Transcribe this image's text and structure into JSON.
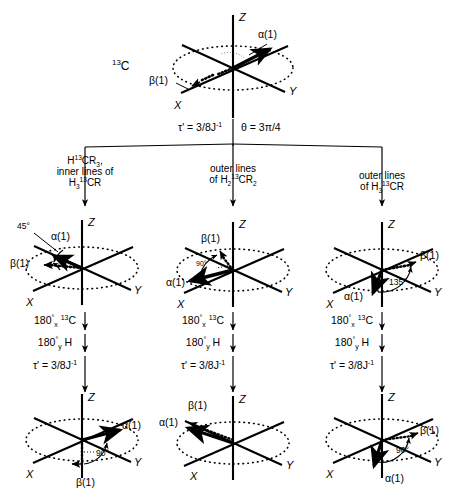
{
  "figure": {
    "nucleus_label": "13C",
    "nucleus_label_html": "C",
    "nucleus_superscript": "13"
  },
  "axes": {
    "z": "Z",
    "x": "X",
    "y": "Y"
  },
  "vectors": {
    "alpha": "α(1)",
    "beta": "β(1)"
  },
  "top": {
    "tau_label": "τ' = 3/8J",
    "tau_exponent": "-1",
    "theta_label": "θ = 3π/4"
  },
  "columns": [
    {
      "header_line1": "H",
      "header_sup1": "13",
      "header_rest1": "CR",
      "header_sub1": "3",
      "header_line1_tail": ",",
      "header_line2": "inner lines of",
      "header_line3_a": "H",
      "header_line3_sub": "3",
      "header_line3_sup": "13",
      "header_line3_b": "CR",
      "mid_angle": "45°",
      "pulse1_a": "180",
      "pulse1_deg": "°",
      "pulse1_sub": "x",
      "pulse1_sup": "13",
      "pulse1_b": "C",
      "pulse2_a": "180",
      "pulse2_deg": "°",
      "pulse2_sub": "y",
      "pulse2_b": "H",
      "tau": "τ' = 3/8J",
      "tau_exp": "-1",
      "bottom_angle": "90°"
    },
    {
      "header_line1": "outer lines",
      "header_line2_a": "of H",
      "header_line2_sub1": "2",
      "header_line2_sup": "13",
      "header_line2_b": "CR",
      "header_line2_sub2": "2",
      "mid_angle": "90°",
      "pulse1_a": "180",
      "pulse1_deg": "°",
      "pulse1_sub": "x",
      "pulse1_sup": "13",
      "pulse1_b": "C",
      "pulse2_a": "180",
      "pulse2_deg": "°",
      "pulse2_sub": "y",
      "pulse2_b": "H",
      "tau": "τ' = 3/8J",
      "tau_exp": "-1",
      "bottom_angle": ""
    },
    {
      "header_line1": "outer lines",
      "header_line2_a": "of H",
      "header_line2_sub1": "3",
      "header_line2_sup": "13",
      "header_line2_b": "CR",
      "mid_angle": "135°",
      "pulse1_a": "180",
      "pulse1_deg": "°",
      "pulse1_sub": "x",
      "pulse1_sup": "13",
      "pulse1_b": "C",
      "pulse2_a": "180",
      "pulse2_deg": "°",
      "pulse2_sub": "y",
      "pulse2_b": "H",
      "tau": "τ' = 3/8J",
      "tau_exp": "-1",
      "bottom_angle": "90°"
    }
  ],
  "colors": {
    "ink": "#000000",
    "paper": "#ffffff"
  }
}
